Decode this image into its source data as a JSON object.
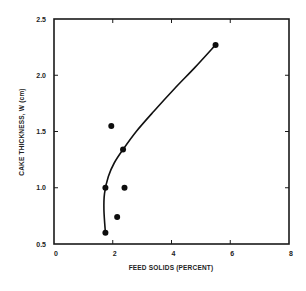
{
  "chart_data": {
    "type": "scatter",
    "title": "",
    "xlabel": "FEED SOLIDS (PERCENT)",
    "ylabel": "CAKE THICKNESS, W (cm)",
    "xlim": [
      0,
      8
    ],
    "ylim": [
      0.5,
      2.5
    ],
    "xticks": [
      0,
      2,
      4,
      6,
      8
    ],
    "yticks": [
      0.5,
      1.0,
      1.5,
      2.0,
      2.5
    ],
    "xtick_labels": [
      "0",
      "2",
      "4",
      "6",
      "8"
    ],
    "ytick_labels": [
      "0.5",
      "1.0",
      "1.5",
      "2.0",
      "2.5"
    ],
    "grid": false,
    "legend": null,
    "series": [
      {
        "name": "measured",
        "kind": "scatter",
        "x": [
          1.95,
          2.35,
          1.75,
          2.4,
          2.15,
          1.75,
          5.5
        ],
        "y": [
          1.55,
          1.34,
          1.0,
          1.0,
          0.74,
          0.6,
          2.27
        ]
      },
      {
        "name": "fitted curve",
        "kind": "line",
        "x": [
          1.75,
          1.7,
          1.72,
          1.85,
          2.05,
          2.35,
          2.8,
          3.4,
          4.1,
          4.8,
          5.5
        ],
        "y": [
          0.6,
          0.8,
          0.95,
          1.1,
          1.22,
          1.34,
          1.5,
          1.68,
          1.88,
          2.07,
          2.27
        ]
      }
    ]
  }
}
